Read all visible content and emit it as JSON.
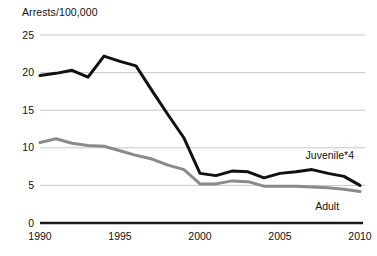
{
  "chart_data": {
    "type": "line",
    "title": "Arrests/100,000",
    "xlabel": "",
    "ylabel": "Arrests/100,000",
    "xlim": [
      1990,
      2010
    ],
    "ylim": [
      0,
      25
    ],
    "grid": true,
    "legend_position": "inline-right",
    "yticks": [
      "0",
      "5",
      "10",
      "15",
      "20",
      "25"
    ],
    "ytick_values": [
      0,
      5,
      10,
      15,
      20,
      25
    ],
    "xticks": [
      "1990",
      "1995",
      "2000",
      "2005",
      "2010"
    ],
    "xtick_values": [
      1990,
      1995,
      2000,
      2005,
      2010
    ],
    "x": [
      1990,
      1991,
      1992,
      1993,
      1994,
      1995,
      1996,
      1997,
      1998,
      1999,
      2000,
      2001,
      2002,
      2003,
      2004,
      2005,
      2006,
      2007,
      2008,
      2009,
      2010
    ],
    "series": [
      {
        "name": "Juvenile*4",
        "color": "#111111",
        "width": 3.0,
        "label_x": 2006.6,
        "label_y": 8.9,
        "values": [
          19.6,
          19.9,
          20.3,
          19.4,
          22.2,
          21.5,
          20.9,
          17.6,
          14.4,
          11.3,
          6.6,
          6.3,
          6.9,
          6.8,
          6.0,
          6.6,
          6.8,
          7.1,
          6.6,
          6.2,
          5.0
        ]
      },
      {
        "name": "Adult",
        "color": "#8a8a8a",
        "width": 3.0,
        "label_x": 2007.2,
        "label_y": 2.1,
        "values": [
          10.7,
          11.2,
          10.6,
          10.3,
          10.2,
          9.6,
          9.0,
          8.5,
          7.7,
          7.1,
          5.2,
          5.2,
          5.6,
          5.5,
          4.9,
          4.9,
          4.9,
          4.8,
          4.7,
          4.5,
          4.2
        ]
      }
    ],
    "colors": {
      "juvenile_line": "#111111",
      "adult_line": "#8a8a8a",
      "gridline": "#c8c8c8",
      "baseline": "#1a1a1a",
      "background": "#ffffff",
      "text": "#111111"
    }
  }
}
